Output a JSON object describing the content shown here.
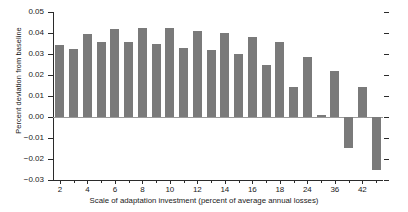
{
  "chart_data": {
    "type": "bar",
    "title": "",
    "xlabel": "Scale of adaptation investment (percent of average annual losses)",
    "ylabel": "Percent deviation from baseline",
    "ylim": [
      -0.03,
      0.05
    ],
    "ytick_labels": [
      "0.05",
      "0.04",
      "0.03",
      "0.02",
      "0.01",
      "0.00",
      "−0.01",
      "−0.02",
      "−0.03"
    ],
    "ytick_values": [
      0.05,
      0.04,
      0.03,
      0.02,
      0.01,
      0.0,
      -0.01,
      -0.02,
      -0.03
    ],
    "xtick_labels": [
      "2",
      "4",
      "6",
      "8",
      "10",
      "12",
      "14",
      "16",
      "18",
      "24",
      "36",
      "42"
    ],
    "grid": false,
    "legend": null,
    "bar_color": "#7a7a7a",
    "axis_color": "#2b2b2b",
    "categories": [
      "2",
      "3",
      "4",
      "5",
      "6",
      "7",
      "8",
      "9",
      "10",
      "11",
      "12",
      "13",
      "14",
      "15",
      "16",
      "17",
      "18",
      "20",
      "24",
      "30",
      "36",
      "40",
      "42",
      "44"
    ],
    "values": [
      0.0345,
      0.0325,
      0.0395,
      0.0355,
      0.0418,
      0.0355,
      0.0422,
      0.0348,
      0.0422,
      0.0327,
      0.0408,
      0.0318,
      0.0398,
      0.0298,
      0.0382,
      0.0248,
      0.0355,
      0.0145,
      0.0288,
      0.0008,
      0.0218,
      -0.0148,
      0.0142,
      -0.0252
    ]
  }
}
